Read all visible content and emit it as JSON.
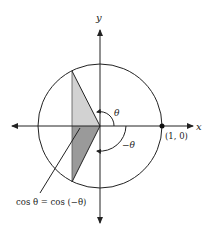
{
  "diagram": {
    "axes": {
      "x_label": "x",
      "y_label": "y"
    },
    "point_label": "(1, 0)",
    "angle_positive": "θ",
    "angle_negative": "−θ",
    "caption": "cos θ = cos (−θ)",
    "colors": {
      "upper_triangle": "#d2d2d2",
      "lower_triangle": "#9a9a9a",
      "stroke": "#222222"
    }
  }
}
